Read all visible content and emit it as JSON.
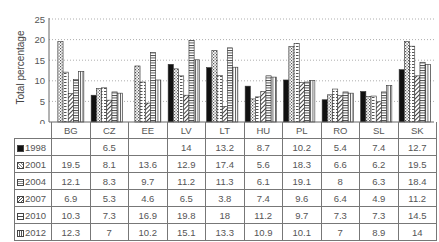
{
  "chart_data": {
    "type": "bar",
    "title": "",
    "xlabel": "",
    "ylabel": "Total percentage",
    "ylim": [
      0,
      25
    ],
    "yticks": [
      0,
      5,
      10,
      15,
      20,
      25
    ],
    "grid": "horizontal dotted",
    "legend_position": "table-left",
    "categories": [
      "BG",
      "CZ",
      "EE",
      "LV",
      "LT",
      "HU",
      "PL",
      "RO",
      "SL",
      "SK"
    ],
    "series": [
      {
        "name": "1998",
        "pattern": "solid-black",
        "values": [
          null,
          6.5,
          null,
          14,
          13.2,
          8.7,
          10.2,
          5.4,
          7.4,
          12.7
        ]
      },
      {
        "name": "2001",
        "pattern": "dotted",
        "values": [
          19.5,
          8.1,
          13.6,
          12.9,
          17.4,
          5.6,
          18.3,
          6.6,
          6.2,
          19.5
        ]
      },
      {
        "name": "2004",
        "pattern": "dashed-horizontal",
        "values": [
          12.1,
          8.3,
          9.7,
          11.2,
          11.3,
          6.1,
          19.1,
          8,
          6.3,
          18.4
        ]
      },
      {
        "name": "2007",
        "pattern": "diagonal",
        "values": [
          6.9,
          5.3,
          4.6,
          6.5,
          3.8,
          7.4,
          9.6,
          6.4,
          4.9,
          11.2
        ]
      },
      {
        "name": "2010",
        "pattern": "horizontal-lines",
        "values": [
          10.3,
          7.3,
          16.9,
          19.8,
          18,
          11.2,
          9.7,
          7.3,
          7.3,
          14.5
        ]
      },
      {
        "name": "2012",
        "pattern": "vertical-lines",
        "values": [
          12.3,
          7,
          10.2,
          15.1,
          13.3,
          10.9,
          10.1,
          7,
          8.9,
          14
        ]
      }
    ]
  },
  "table": {
    "rows": [
      {
        "label": "1998",
        "cells": [
          "",
          "6.5",
          "",
          "14",
          "13.2",
          "8.7",
          "10.2",
          "5.4",
          "7.4",
          "12.7"
        ]
      },
      {
        "label": "2001",
        "cells": [
          "19.5",
          "8.1",
          "13.6",
          "12.9",
          "17.4",
          "5.6",
          "18.3",
          "6.6",
          "6.2",
          "19.5"
        ]
      },
      {
        "label": "2004",
        "cells": [
          "12.1",
          "8.3",
          "9.7",
          "11.2",
          "11.3",
          "6.1",
          "19.1",
          "8",
          "6.3",
          "18.4"
        ]
      },
      {
        "label": "2007",
        "cells": [
          "6.9",
          "5.3",
          "4.6",
          "6.5",
          "3.8",
          "7.4",
          "9.6",
          "6.4",
          "4.9",
          "11.2"
        ]
      },
      {
        "label": "2010",
        "cells": [
          "10.3",
          "7.3",
          "16.9",
          "19.8",
          "18",
          "11.2",
          "9.7",
          "7.3",
          "7.3",
          "14.5"
        ]
      },
      {
        "label": "2012",
        "cells": [
          "12.3",
          "7",
          "10.2",
          "15.1",
          "13.3",
          "10.9",
          "10.1",
          "7",
          "8.9",
          "14"
        ]
      }
    ]
  }
}
